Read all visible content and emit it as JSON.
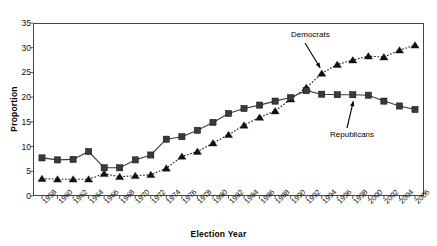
{
  "chart_data": {
    "type": "line",
    "title": "",
    "xlabel": "Election Year",
    "ylabel": "Proportion",
    "xlim": [
      1958,
      2006
    ],
    "ylim": [
      0,
      35
    ],
    "yticks": [
      0,
      5,
      10,
      15,
      20,
      25,
      30,
      35
    ],
    "grid": false,
    "legend_position": "inline-annotations",
    "categories": [
      "1958",
      "1960",
      "1962",
      "1964",
      "1966",
      "1968",
      "1970",
      "1972",
      "1974",
      "1976",
      "1978",
      "1980",
      "1982",
      "1984",
      "1986",
      "1988",
      "1990",
      "1992",
      "1994",
      "1996",
      "1998",
      "2000",
      "2002",
      "2004",
      "2006"
    ],
    "series": [
      {
        "name": "Democrats",
        "marker": "triangle",
        "linestyle": "dotted",
        "color": "#1a1a1a",
        "values": [
          3.5,
          3.4,
          3.4,
          3.4,
          4.5,
          3.9,
          4.1,
          4.3,
          5.6,
          8.0,
          9.0,
          10.7,
          12.4,
          14.3,
          15.9,
          17.2,
          19.6,
          21.9,
          24.8,
          26.6,
          27.5,
          28.3,
          28.1,
          29.5,
          30.5
        ]
      },
      {
        "name": "Republicans",
        "marker": "square",
        "linestyle": "solid",
        "color": "#3a3a3a",
        "values": [
          7.7,
          7.3,
          7.4,
          9.0,
          5.7,
          5.7,
          7.3,
          8.3,
          11.5,
          12.0,
          13.3,
          14.9,
          16.7,
          17.7,
          18.4,
          19.2,
          19.9,
          21.3,
          20.6,
          20.5,
          20.5,
          20.4,
          19.2,
          18.2,
          17.5
        ]
      }
    ],
    "annotations": [
      {
        "text": "Democrats",
        "series": "Democrats",
        "points_to_year": "1994"
      },
      {
        "text": "Republicans",
        "series": "Republicans",
        "points_to_year": "1998"
      }
    ]
  },
  "axes": {
    "y_title": "Proportion",
    "x_title": "Election Year"
  }
}
